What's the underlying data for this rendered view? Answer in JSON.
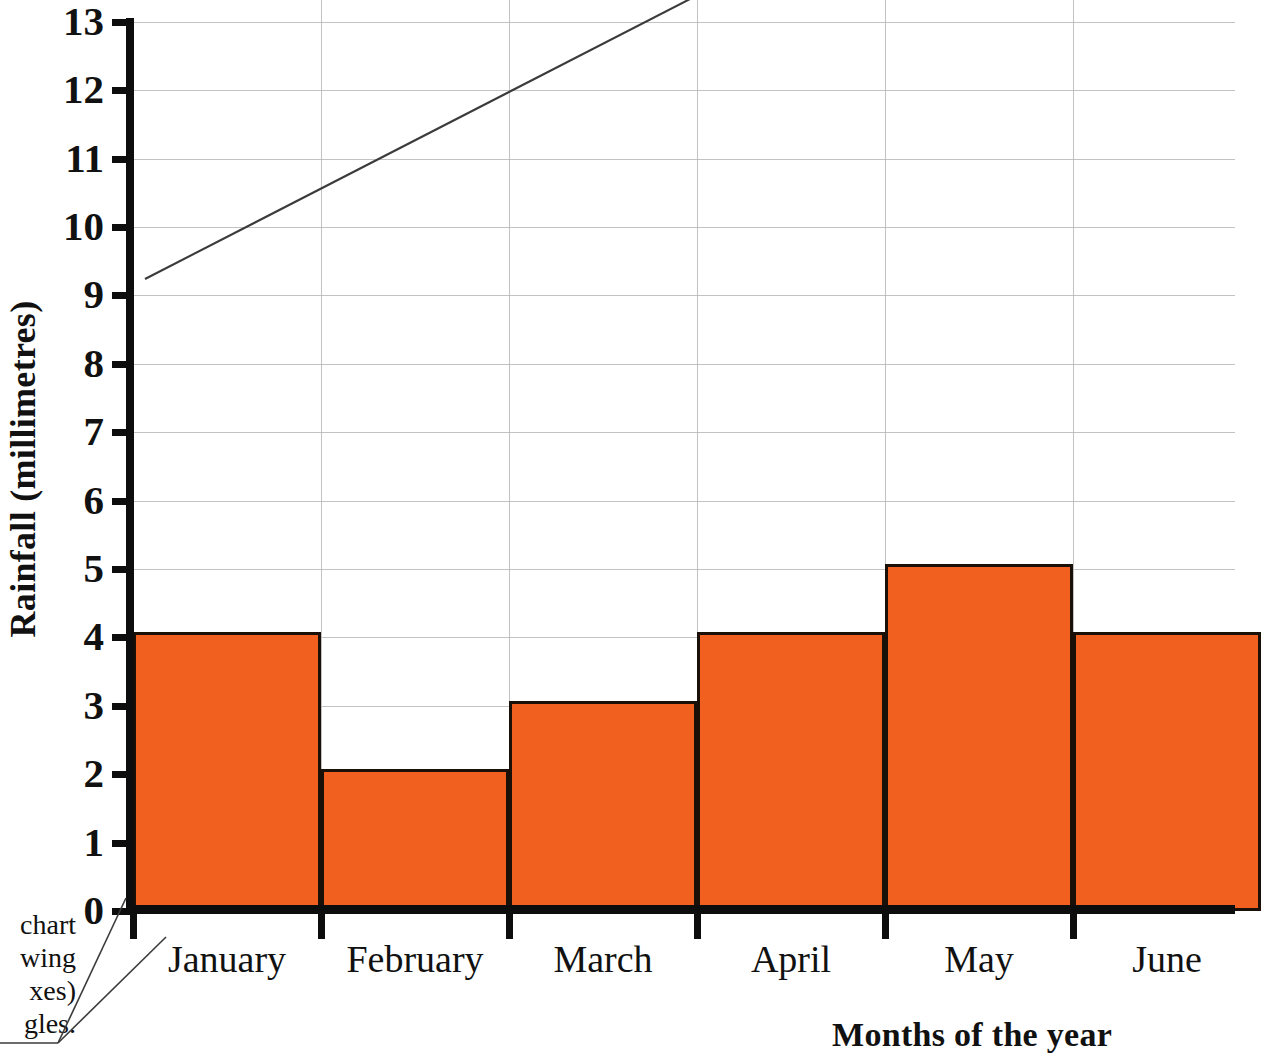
{
  "chart_data": {
    "type": "bar",
    "title": "",
    "subtitle": "",
    "xlabel": "Months of the year",
    "ylabel": "Rainfall (millimetres)",
    "categories": [
      "January",
      "February",
      "March",
      "April",
      "May",
      "June"
    ],
    "values": [
      4,
      2,
      3,
      4,
      5,
      4
    ],
    "series": [
      {
        "name": "Rainfall",
        "values": [
          4,
          2,
          3,
          4,
          5,
          4
        ]
      }
    ],
    "ylim": [
      0,
      13
    ],
    "ytick_labels": [
      "0",
      "1",
      "2",
      "3",
      "4",
      "5",
      "6",
      "7",
      "8",
      "9",
      "10",
      "11",
      "12",
      "13"
    ],
    "ytick_values": [
      0,
      1,
      2,
      3,
      4,
      5,
      6,
      7,
      8,
      9,
      10,
      11,
      12,
      13
    ],
    "ytick_step": 1,
    "grid": true,
    "grid_axis": "both",
    "legend": false,
    "legend_position": "none",
    "bar_gap": 0,
    "note": "June bar is clipped by the right edge of the image",
    "colors": {
      "bar_fill": "#F1601F",
      "bar_outline": "#1A1008",
      "axis": "#0D0D0D",
      "grid": "#B9B9B9",
      "text": "#111111",
      "leader_line": "#3B3B3B",
      "background": "#FFFFFF"
    }
  },
  "axis_titles": {
    "y": "Rainfall (millimetres)",
    "x": "Months of the year"
  },
  "annotation": {
    "lines": [
      "chart",
      "wing",
      "xes)",
      "gles."
    ],
    "clipped": "true"
  }
}
